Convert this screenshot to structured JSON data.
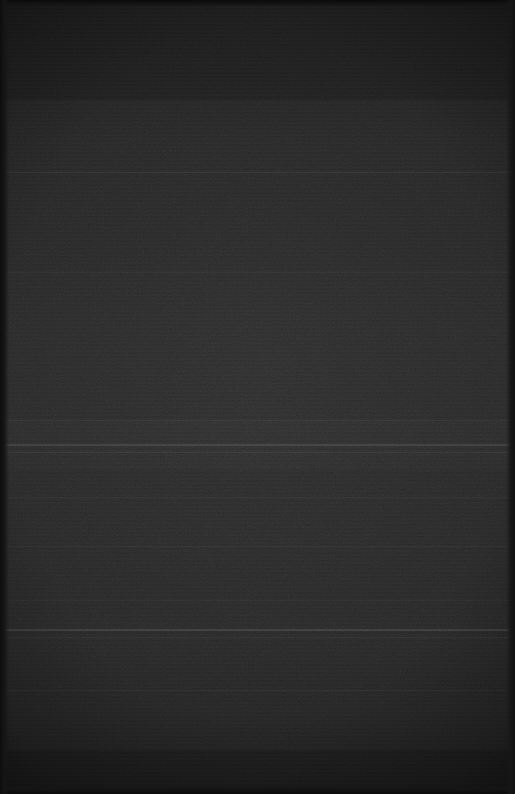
{
  "frame": {
    "width": 515,
    "height": 794,
    "description": "Near-black underexposed frame with no legible interface content",
    "visible_text": "",
    "caption": "Dark frame — no discernible text, icons or controls"
  },
  "colors": {
    "base": "#292929",
    "top_shadow": "#1c1c1c",
    "mid_tone": "#2e2e2e",
    "bottom_shadow": "#1a1a1a",
    "edge_dark": "#0d0d0d",
    "hairline": "#3a3a3a"
  },
  "luminance_bands": [
    {
      "name": "top-shadow-band",
      "top": 0,
      "height": 100,
      "tone": "#1f1f1f",
      "opacity": 0.55
    },
    {
      "name": "upper-mid-band",
      "top": 100,
      "height": 72,
      "tone": "#2a2a2a",
      "opacity": 0.3
    },
    {
      "name": "mid-band",
      "top": 172,
      "height": 100,
      "tone": "#2c2c2c",
      "opacity": 0.22
    },
    {
      "name": "center-band",
      "top": 272,
      "height": 148,
      "tone": "#2d2d2d",
      "opacity": 0.2
    },
    {
      "name": "bright-mid-band",
      "top": 420,
      "height": 50,
      "tone": "#313131",
      "opacity": 0.28
    },
    {
      "name": "lower-mid-band",
      "top": 470,
      "height": 158,
      "tone": "#2c2c2c",
      "opacity": 0.18
    },
    {
      "name": "lower-band",
      "top": 630,
      "height": 120,
      "tone": "#2a2a2a",
      "opacity": 0.2
    },
    {
      "name": "bottom-shadow-band",
      "top": 750,
      "height": 44,
      "tone": "#1b1b1b",
      "opacity": 0.55
    }
  ],
  "hairlines": [
    {
      "name": "hairline-172",
      "top": 172,
      "height": 1,
      "alpha": 0.055
    },
    {
      "name": "hairline-272",
      "top": 272,
      "height": 1,
      "alpha": 0.035
    },
    {
      "name": "hairline-420",
      "top": 420,
      "height": 1,
      "alpha": 0.04
    },
    {
      "name": "hairline-444",
      "top": 444,
      "height": 2,
      "alpha": 0.085
    },
    {
      "name": "hairline-452",
      "top": 452,
      "height": 1,
      "alpha": 0.05
    },
    {
      "name": "hairline-497",
      "top": 497,
      "height": 1,
      "alpha": 0.03
    },
    {
      "name": "hairline-546",
      "top": 546,
      "height": 1,
      "alpha": 0.028
    },
    {
      "name": "hairline-600",
      "top": 600,
      "height": 1,
      "alpha": 0.03
    },
    {
      "name": "hairline-629",
      "top": 629,
      "height": 2,
      "alpha": 0.095
    },
    {
      "name": "hairline-637",
      "top": 637,
      "height": 1,
      "alpha": 0.045
    },
    {
      "name": "hairline-690",
      "top": 690,
      "height": 1,
      "alpha": 0.03
    }
  ],
  "edges": {
    "left_width": 9,
    "right_width": 9,
    "top_height": 7,
    "bottom_height": 9
  }
}
